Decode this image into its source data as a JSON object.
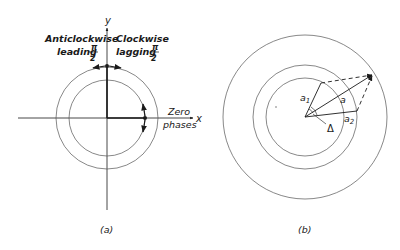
{
  "panel_a": {
    "caption": "(a)",
    "axis_x_label": "x",
    "axis_y_label": "y",
    "label_anticlockwise_1": "Anticlockwise",
    "label_anticlockwise_2": "leading",
    "label_clockwise_1": "Clockwise",
    "label_clockwise_2": "lagging",
    "pi_numerator": "π",
    "pi_denominator": "2",
    "label_zero_1": "Zero",
    "label_zero_2": "phases"
  },
  "panel_b": {
    "caption": "(b)",
    "label_a1": "a",
    "label_a1_sub": "1",
    "label_a2": "a",
    "label_a2_sub": "2",
    "label_a": "a",
    "label_delta": "Δ"
  },
  "colors": {
    "ink": "#1a1a1a",
    "circle": "#555555"
  }
}
